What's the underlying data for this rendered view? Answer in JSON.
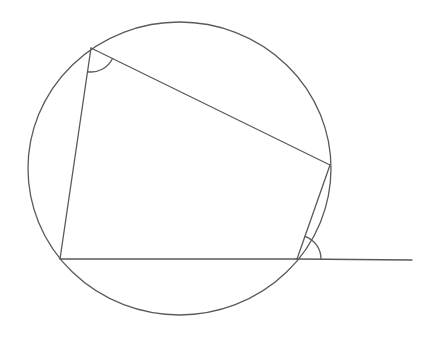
{
  "diagram": {
    "width": 443,
    "height": 343,
    "background": "#ffffff",
    "stroke_color": "#5a5a5a",
    "stroke_width": 1.3,
    "circle": {
      "cx": 179.5,
      "cy": 168.5,
      "rx": 151.5,
      "ry": 146.5
    },
    "vertices": {
      "A": {
        "x": 91,
        "y": 48
      },
      "B": {
        "x": 330,
        "y": 165
      },
      "C": {
        "x": 297,
        "y": 259
      },
      "D": {
        "x": 60,
        "y": 259
      }
    },
    "extension": {
      "from": "C",
      "to": {
        "x": 412,
        "y": 260
      }
    },
    "angle_marks": [
      {
        "at": "A",
        "radius": 24,
        "between": [
          "D",
          "B"
        ],
        "description": "interior angle at top-left vertex"
      },
      {
        "at": "C",
        "radius": 24,
        "between": [
          "B",
          "extension"
        ],
        "description": "exterior angle at bottom-right vertex"
      }
    ]
  }
}
